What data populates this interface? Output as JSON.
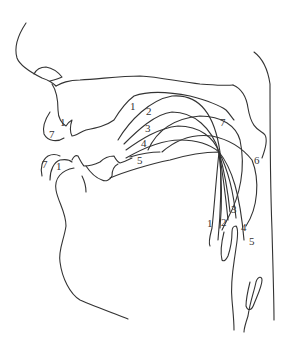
{
  "diagram": {
    "title": "",
    "line_color": "#333333",
    "background": "#ffffff",
    "labels": {
      "upper_lip_1": "1",
      "upper_lip_7": "7",
      "lower_lip_7": "7",
      "lower_lip_1": "1",
      "arc_1": "1",
      "arc_2": "2",
      "arc_3": "3",
      "arc_4": "4",
      "arc_5": "5",
      "arc_6": "6",
      "arc_7": "7",
      "low_1": "1",
      "low_2": "2",
      "low_3": "3",
      "low_4": "4",
      "low_5": "5"
    }
  }
}
